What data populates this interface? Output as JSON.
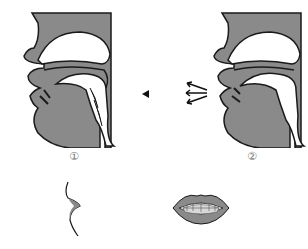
{
  "figures": [
    {
      "id": "1",
      "label": "①",
      "description": "sagittal section, lips closed"
    },
    {
      "id": "2",
      "label": "②",
      "description": "sagittal section, lips open with airflow arrows"
    }
  ],
  "lips": [
    {
      "id": "1",
      "description": "side profile of closed lips"
    },
    {
      "id": "2",
      "description": "front view of open lips showing teeth"
    }
  ],
  "colors": {
    "tissue": "#8a8a8a",
    "outline": "#1a1a1a",
    "cavity": "#ffffff",
    "teeth": "#d8d8d8"
  }
}
